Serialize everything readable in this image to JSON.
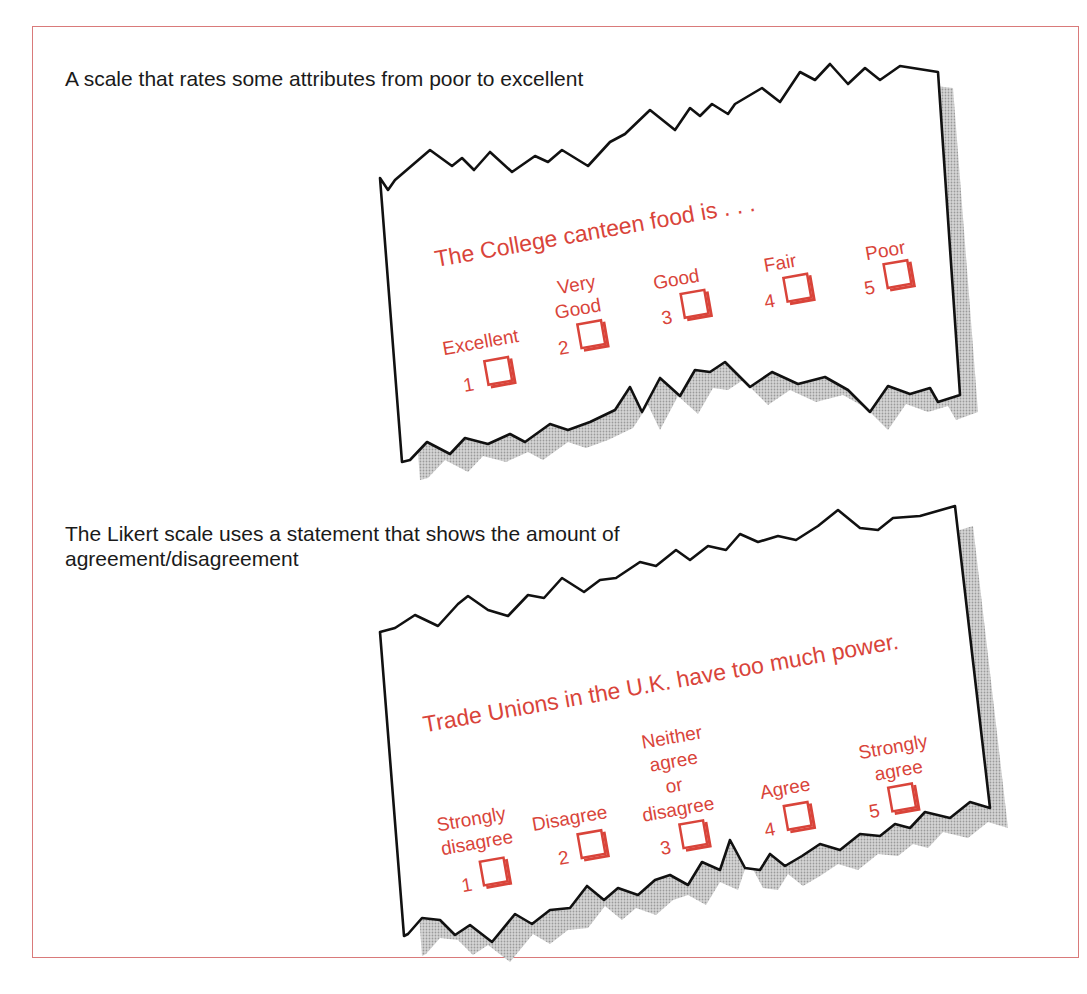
{
  "panels": [
    {
      "caption": "A scale that rates some attributes from poor to excellent",
      "question": "The College canteen food is . . .",
      "options": [
        {
          "number": "1",
          "label_lines": [
            "Excellent"
          ]
        },
        {
          "number": "2",
          "label_lines": [
            "Very",
            "Good"
          ]
        },
        {
          "number": "3",
          "label_lines": [
            "Good"
          ]
        },
        {
          "number": "4",
          "label_lines": [
            "Fair"
          ]
        },
        {
          "number": "5",
          "label_lines": [
            "Poor"
          ]
        }
      ]
    },
    {
      "caption": "The Likert scale uses a statement that shows the amount of agreement/disagreement",
      "question": "Trade Unions in the U.K. have too much power.",
      "options": [
        {
          "number": "1",
          "label_lines": [
            "Strongly",
            "disagree"
          ]
        },
        {
          "number": "2",
          "label_lines": [
            "Disagree"
          ]
        },
        {
          "number": "3",
          "label_lines": [
            "Neither",
            "agree",
            "or",
            "disagree"
          ]
        },
        {
          "number": "4",
          "label_lines": [
            "Agree"
          ]
        },
        {
          "number": "5",
          "label_lines": [
            "Strongly",
            "agree"
          ]
        }
      ]
    }
  ],
  "colors": {
    "accent_red": "#d9443a",
    "frame_border": "#d97a7a",
    "outline": "#111111",
    "shadow": "#bdbdbd"
  }
}
